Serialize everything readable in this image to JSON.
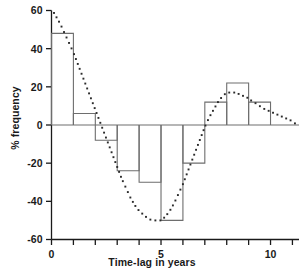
{
  "chart_data": {
    "type": "bar",
    "title": "",
    "xlabel": "Time-lag in years",
    "ylabel": "% frequency",
    "xlim": [
      0,
      11.3
    ],
    "ylim": [
      -60,
      60
    ],
    "grid": false,
    "legend": "none",
    "bar_series": {
      "name": "% frequency",
      "bin_edges": [
        0,
        1,
        2,
        3,
        4,
        5,
        6,
        7,
        8,
        9,
        10,
        11
      ],
      "categories": [
        "0-1",
        "1-2",
        "2-3",
        "3-4",
        "4-5",
        "5-6",
        "6-7",
        "7-8",
        "8-9",
        "9-10",
        "10-11"
      ],
      "values": [
        48,
        6,
        -8,
        -24,
        -30,
        -50,
        -20,
        12,
        22,
        12,
        0
      ]
    },
    "curve_series": {
      "name": "fitted damped cosine",
      "style": "dotted",
      "x": [
        0.0,
        0.2,
        0.4,
        0.6,
        0.8,
        1.0,
        1.2,
        1.4,
        1.6,
        1.8,
        2.0,
        2.2,
        2.4,
        2.6,
        2.8,
        3.0,
        3.2,
        3.4,
        3.6,
        3.8,
        4.0,
        4.2,
        4.4,
        4.6,
        4.8,
        5.0,
        5.2,
        5.4,
        5.6,
        5.8,
        6.0,
        6.2,
        6.4,
        6.6,
        6.8,
        7.0,
        7.2,
        7.4,
        7.6,
        7.8,
        8.0,
        8.2,
        8.4,
        8.6,
        8.8,
        9.0,
        9.2,
        9.4,
        9.6,
        9.8,
        10.0,
        10.2,
        10.4,
        10.6,
        10.8,
        11.0,
        11.2
      ],
      "y": [
        61,
        57,
        53,
        48,
        43,
        38,
        32,
        26,
        20,
        14,
        8,
        2,
        -4,
        -10,
        -16,
        -22,
        -28,
        -33,
        -38,
        -42,
        -45,
        -47,
        -49,
        -50,
        -50,
        -50,
        -48,
        -45,
        -41,
        -36,
        -31,
        -25,
        -19,
        -13,
        -7,
        -1,
        4,
        8,
        12,
        15,
        17,
        17,
        17,
        16,
        15,
        14,
        12,
        11,
        9,
        8,
        7,
        6,
        5,
        4,
        3,
        2,
        0
      ]
    },
    "y_ticks": [
      -60,
      -40,
      -20,
      0,
      20,
      40,
      60
    ],
    "y_tick_labels": [
      "-60",
      "-40",
      "-20",
      "0",
      "20",
      "40",
      "60"
    ],
    "x_ticks": [
      0,
      1,
      2,
      3,
      4,
      5,
      6,
      7,
      8,
      9,
      10,
      11
    ],
    "x_tick_labels_shown": {
      "0": "0",
      "5": "5",
      "10": "10"
    },
    "colors": {
      "axis": "#1a1a1a",
      "bar_edge": "#6e6e6e",
      "bar_fill": "none",
      "curve_dot": "#2b2b2b",
      "text": "#1a1a1a",
      "background": "#ffffff"
    }
  },
  "labels": {
    "y_axis_title": "% frequency",
    "x_axis_title": "Time-lag in years"
  }
}
